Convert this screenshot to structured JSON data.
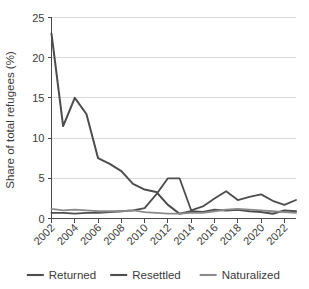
{
  "chart_data": {
    "type": "line",
    "title": "",
    "xlabel": "",
    "ylabel": "Share of total refugees (%)",
    "ylim": [
      0,
      25
    ],
    "yticks": [
      0,
      5,
      10,
      15,
      20,
      25
    ],
    "ytick_labels": [
      "0",
      "5",
      "10",
      "15",
      "20",
      "25"
    ],
    "grid": true,
    "legend_position": "bottom",
    "x": [
      2002,
      2003,
      2004,
      2005,
      2006,
      2007,
      2008,
      2009,
      2010,
      2011,
      2012,
      2013,
      2014,
      2015,
      2016,
      2017,
      2018,
      2019,
      2020,
      2021,
      2022,
      2023
    ],
    "xtick_values": [
      2002,
      2004,
      2006,
      2008,
      2010,
      2012,
      2014,
      2016,
      2018,
      2020,
      2022
    ],
    "xtick_labels": [
      "2002",
      "2004",
      "2006",
      "2008",
      "2010",
      "2012",
      "2014",
      "2016",
      "2018",
      "2020",
      "2022"
    ],
    "series": [
      {
        "name": "Returned",
        "color": "#4d4d4d",
        "width": 2.0,
        "values": [
          23.0,
          11.5,
          15.0,
          13.0,
          7.5,
          6.8,
          5.9,
          4.3,
          3.6,
          3.3,
          1.7,
          0.6,
          0.9,
          0.8,
          1.1,
          1.0,
          1.1,
          0.9,
          0.8,
          0.6,
          1.0,
          0.9
        ]
      },
      {
        "name": "Resettled",
        "color": "#4d4d4d",
        "width": 1.8,
        "values": [
          0.7,
          0.7,
          0.6,
          0.7,
          0.7,
          0.8,
          0.9,
          1.0,
          1.3,
          3.0,
          5.0,
          5.0,
          1.0,
          1.5,
          2.5,
          3.4,
          2.3,
          2.7,
          3.0,
          2.2,
          1.7,
          2.3
        ]
      },
      {
        "name": "Naturalized",
        "color": "#8a8a8a",
        "width": 1.8,
        "values": [
          1.2,
          1.0,
          1.1,
          1.0,
          0.9,
          0.9,
          0.9,
          1.0,
          0.8,
          0.7,
          0.6,
          0.6,
          0.7,
          0.7,
          0.9,
          1.1,
          1.2,
          1.1,
          1.0,
          0.9,
          0.8,
          0.7
        ]
      }
    ]
  },
  "legend": {
    "items": [
      {
        "label": "Returned",
        "color": "#4d4d4d"
      },
      {
        "label": "Resettled",
        "color": "#4d4d4d"
      },
      {
        "label": "Naturalized",
        "color": "#8a8a8a"
      }
    ]
  }
}
